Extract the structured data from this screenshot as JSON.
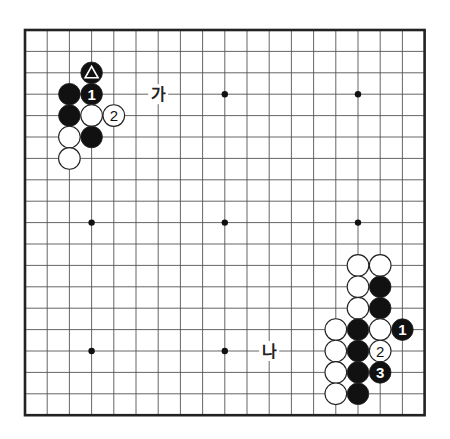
{
  "board": {
    "size": 19,
    "origin_x": 25,
    "origin_y": 30,
    "spacing_x": 22.2,
    "spacing_y": 21.4,
    "line_color": "#555555",
    "border_color": "#222222",
    "hoshi": [
      [
        3,
        3
      ],
      [
        9,
        3
      ],
      [
        15,
        3
      ],
      [
        3,
        9
      ],
      [
        9,
        9
      ],
      [
        15,
        9
      ],
      [
        3,
        15
      ],
      [
        9,
        15
      ],
      [
        15,
        15
      ]
    ]
  },
  "stones": [
    {
      "col": 3,
      "row": 2,
      "color": "black",
      "mark": "triangle",
      "label": ""
    },
    {
      "col": 2,
      "row": 3,
      "color": "black",
      "mark": "",
      "label": ""
    },
    {
      "col": 3,
      "row": 3,
      "color": "black",
      "mark": "",
      "label": "1"
    },
    {
      "col": 2,
      "row": 4,
      "color": "black",
      "mark": "",
      "label": ""
    },
    {
      "col": 3,
      "row": 4,
      "color": "white",
      "mark": "",
      "label": ""
    },
    {
      "col": 4,
      "row": 4,
      "color": "white",
      "mark": "",
      "label": "2"
    },
    {
      "col": 2,
      "row": 5,
      "color": "white",
      "mark": "",
      "label": ""
    },
    {
      "col": 3,
      "row": 5,
      "color": "black",
      "mark": "",
      "label": ""
    },
    {
      "col": 2,
      "row": 6,
      "color": "white",
      "mark": "",
      "label": ""
    },
    {
      "col": 15,
      "row": 11,
      "color": "white",
      "mark": "",
      "label": ""
    },
    {
      "col": 16,
      "row": 11,
      "color": "white",
      "mark": "",
      "label": ""
    },
    {
      "col": 15,
      "row": 12,
      "color": "white",
      "mark": "",
      "label": ""
    },
    {
      "col": 16,
      "row": 12,
      "color": "black",
      "mark": "",
      "label": ""
    },
    {
      "col": 15,
      "row": 13,
      "color": "white",
      "mark": "",
      "label": ""
    },
    {
      "col": 16,
      "row": 13,
      "color": "black",
      "mark": "",
      "label": ""
    },
    {
      "col": 14,
      "row": 14,
      "color": "white",
      "mark": "",
      "label": ""
    },
    {
      "col": 15,
      "row": 14,
      "color": "black",
      "mark": "",
      "label": ""
    },
    {
      "col": 16,
      "row": 14,
      "color": "white",
      "mark": "",
      "label": ""
    },
    {
      "col": 17,
      "row": 14,
      "color": "black",
      "mark": "",
      "label": "1"
    },
    {
      "col": 14,
      "row": 15,
      "color": "white",
      "mark": "",
      "label": ""
    },
    {
      "col": 15,
      "row": 15,
      "color": "black",
      "mark": "",
      "label": ""
    },
    {
      "col": 16,
      "row": 15,
      "color": "white",
      "mark": "",
      "label": "2"
    },
    {
      "col": 14,
      "row": 16,
      "color": "white",
      "mark": "",
      "label": ""
    },
    {
      "col": 15,
      "row": 16,
      "color": "black",
      "mark": "",
      "label": ""
    },
    {
      "col": 16,
      "row": 16,
      "color": "black",
      "mark": "",
      "label": "3"
    },
    {
      "col": 14,
      "row": 17,
      "color": "white",
      "mark": "",
      "label": ""
    },
    {
      "col": 15,
      "row": 17,
      "color": "black",
      "mark": "",
      "label": ""
    }
  ],
  "point_labels": [
    {
      "col": 6,
      "row": 3,
      "text": "가"
    },
    {
      "col": 11,
      "row": 15,
      "text": "나"
    }
  ]
}
